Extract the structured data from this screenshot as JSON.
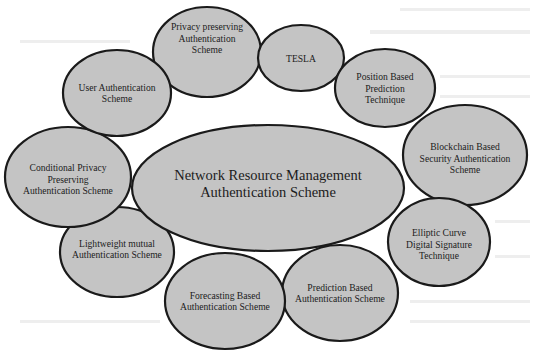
{
  "diagram": {
    "type": "bubble-cluster",
    "fill_color": "#c4c4c4",
    "stroke_color": "#1a1a1a",
    "center": {
      "id": "network-resource-management",
      "lines": [
        "Network Resource Management",
        "Authentication Scheme"
      ]
    },
    "nodes": [
      {
        "id": "privacy-preserving",
        "lines": [
          "Privacy preserving",
          "Authentication",
          "Scheme"
        ]
      },
      {
        "id": "tesla",
        "lines": [
          "TESLA"
        ]
      },
      {
        "id": "position-based-prediction",
        "lines": [
          "Position Based",
          "Prediction",
          "Technique"
        ]
      },
      {
        "id": "blockchain-based-security",
        "lines": [
          "Blockchain Based",
          "Security Authentication",
          "Scheme"
        ]
      },
      {
        "id": "elliptic-curve-digital-signature",
        "lines": [
          "Elliptic Curve",
          "Digital Signature",
          "Technique"
        ]
      },
      {
        "id": "prediction-based",
        "lines": [
          "Prediction Based",
          "Authentication Scheme"
        ]
      },
      {
        "id": "forecasting-based",
        "lines": [
          "Forecasting Based",
          "Authentication Scheme"
        ]
      },
      {
        "id": "lightweight-mutual",
        "lines": [
          "Lightweight mutual",
          "Authentication Scheme"
        ]
      },
      {
        "id": "conditional-privacy-preserving",
        "lines": [
          "Conditional Privacy",
          "Preserving",
          "Authentication Scheme"
        ]
      },
      {
        "id": "user-authentication",
        "lines": [
          "User Authentication",
          "Scheme"
        ]
      }
    ]
  }
}
